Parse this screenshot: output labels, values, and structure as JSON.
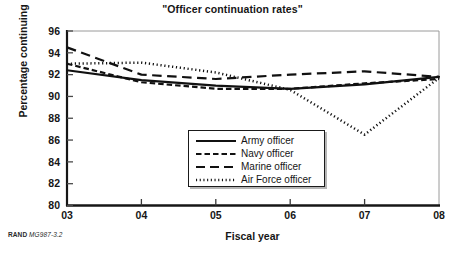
{
  "chart_data": {
    "type": "line",
    "title": "\"Officer continuation rates\"",
    "xlabel": "Fiscal year",
    "ylabel": "Percentage continuing",
    "x": [
      "03",
      "04",
      "05",
      "06",
      "07",
      "08"
    ],
    "xtick_labels": [
      "03",
      "04",
      "05",
      "06",
      "07",
      "08"
    ],
    "ytick_labels": [
      "80",
      "82",
      "84",
      "86",
      "88",
      "90",
      "92",
      "94",
      "96"
    ],
    "ylim": [
      80,
      96
    ],
    "ytick_step": 2,
    "grid": false,
    "legend_position": "inside-bottom-center",
    "series": [
      {
        "name": "Army officer",
        "style": "solid",
        "color": "#111111",
        "values": [
          92.4,
          91.5,
          91.0,
          90.7,
          91.1,
          91.8
        ]
      },
      {
        "name": "Navy officer",
        "style": "short-dash",
        "color": "#111111",
        "values": [
          93.0,
          91.3,
          90.7,
          90.7,
          91.2,
          91.6
        ]
      },
      {
        "name": "Marine officer",
        "style": "long-dash",
        "color": "#111111",
        "values": [
          94.5,
          92.0,
          91.6,
          92.0,
          92.3,
          91.8
        ]
      },
      {
        "name": "Air Force officer",
        "style": "dotted",
        "color": "#111111",
        "values": [
          93.0,
          93.1,
          92.2,
          90.6,
          86.5,
          91.7
        ]
      }
    ]
  },
  "legend": {
    "entries": [
      {
        "label": "Army officer",
        "style": "solid"
      },
      {
        "label": "Navy officer",
        "style": "short-dash"
      },
      {
        "label": "Marine officer",
        "style": "long-dash"
      },
      {
        "label": "Air Force officer",
        "style": "dotted"
      }
    ]
  },
  "source_note": {
    "brand": "RAND",
    "document_id": "MG987-3.2"
  }
}
